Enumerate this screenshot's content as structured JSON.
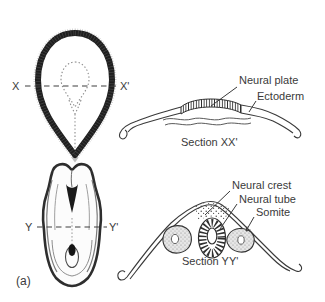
{
  "figure_label": "(a)",
  "colors": {
    "paper": "#ffffff",
    "line": "#3a3a3a",
    "dark_border": "#1f1f1f",
    "stipple_fill": "#e4e4e4"
  },
  "top_left_view": {
    "name": "early embryo dorsal view (gastrula) with section plane X-X'",
    "start_label": "X",
    "end_label": "X'"
  },
  "top_right_section": {
    "caption": "Section XX'",
    "neural_plate_label": "Neural plate",
    "ectoderm_label": "Ectoderm"
  },
  "bottom_left_view": {
    "name": "neurula embryo dorsal view with section plane Y-Y'",
    "start_label": "Y",
    "end_label": "Y'"
  },
  "bottom_right_section": {
    "caption": "Section YY'",
    "neural_crest_label": "Neural crest",
    "neural_tube_label": "Neural tube",
    "somite_label": "Somite"
  }
}
